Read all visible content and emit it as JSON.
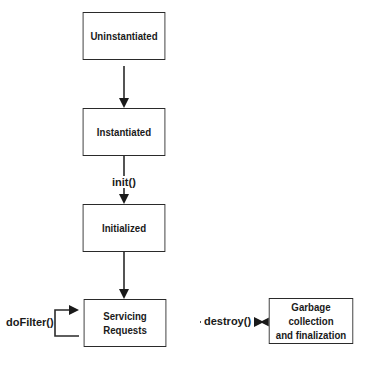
{
  "diagram": {
    "nodes": [
      {
        "id": "uninstantiated",
        "label": "Uninstantiated"
      },
      {
        "id": "instantiated",
        "label": "Instantiated"
      },
      {
        "id": "initialized",
        "label": "Initialized"
      },
      {
        "id": "servicing",
        "label_line1": "Servicing",
        "label_line2": "Requests"
      },
      {
        "id": "garbage",
        "label_line1": "Garbage collection",
        "label_line2": "and finalization"
      }
    ],
    "edges": [
      {
        "from": "uninstantiated",
        "to": "instantiated",
        "label": ""
      },
      {
        "from": "instantiated",
        "to": "initialized",
        "label": "init()"
      },
      {
        "from": "initialized",
        "to": "servicing",
        "label": ""
      },
      {
        "from": "servicing",
        "to": "servicing",
        "label": "doFilter()"
      },
      {
        "from": "servicing",
        "to": "garbage",
        "label": "destroy()"
      }
    ]
  }
}
